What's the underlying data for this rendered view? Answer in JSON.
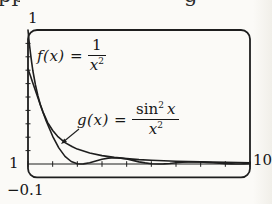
{
  "colors": {
    "ink": "#1e1e1e",
    "paper": "#fbfaf7"
  },
  "figure": {
    "top_cropped_text": {
      "left_fragment": "pp",
      "right_fragment": "g"
    },
    "labels": {
      "f": {
        "prefix": "f(x) =",
        "numerator": "1",
        "den_base": "x",
        "den_exp": "2"
      },
      "g": {
        "prefix": "g(x) =",
        "num_func": "sin",
        "num_exp": "2",
        "num_var": "x",
        "den_base": "x",
        "den_exp": "2"
      }
    },
    "axis_labels": {
      "y_max": "1",
      "x_min": "1",
      "x_max": "10",
      "y_min": "−0.1"
    }
  },
  "chart_data": {
    "type": "line",
    "title": "",
    "xlabel": "",
    "ylabel": "",
    "window": {
      "xmin": 1,
      "xmax": 10,
      "ymin": -0.1,
      "ymax": 1
    },
    "x_tick_step": 1,
    "y_tick_step": 0.1,
    "grid": false,
    "legend_position": "inline-annotations",
    "frame_px": {
      "left": 28,
      "right": 250,
      "top": 30,
      "bottom": 177.4
    },
    "series": [
      {
        "name": "f(x) = 1/x^2",
        "x": [
          1,
          1.05,
          1.1,
          1.15,
          1.2,
          1.3,
          1.4,
          1.5,
          1.6,
          1.8,
          2,
          2.2,
          2.5,
          2.8,
          3,
          3.5,
          4,
          4.5,
          5,
          5.5,
          6,
          6.5,
          7,
          7.5,
          8,
          8.5,
          9,
          9.5,
          10
        ],
        "y": [
          1,
          0.907,
          0.826,
          0.756,
          0.694,
          0.592,
          0.51,
          0.444,
          0.391,
          0.309,
          0.25,
          0.207,
          0.16,
          0.128,
          0.111,
          0.082,
          0.063,
          0.049,
          0.04,
          0.033,
          0.028,
          0.024,
          0.02,
          0.018,
          0.016,
          0.014,
          0.012,
          0.011,
          0.01
        ]
      },
      {
        "name": "g(x) = sin^2(x)/x^2",
        "x": [
          1,
          1.1,
          1.2,
          1.3,
          1.4,
          1.5,
          1.6,
          1.75,
          2,
          2.25,
          2.5,
          2.75,
          3,
          3.14,
          3.25,
          3.5,
          3.75,
          4,
          4.25,
          4.5,
          4.75,
          5,
          5.25,
          5.5,
          5.75,
          6,
          6.28,
          6.5,
          6.75,
          7,
          7.25,
          7.5,
          7.75,
          8,
          8.25,
          8.5,
          8.75,
          9,
          9.25,
          9.42,
          9.6,
          9.75,
          10
        ],
        "y": [
          0.708,
          0.656,
          0.603,
          0.549,
          0.495,
          0.442,
          0.39,
          0.316,
          0.207,
          0.12,
          0.057,
          0.019,
          0.002,
          0,
          0.001,
          0.01,
          0.023,
          0.036,
          0.044,
          0.047,
          0.044,
          0.037,
          0.027,
          0.016,
          0.008,
          0.002,
          0,
          0.001,
          0.004,
          0.009,
          0.013,
          0.016,
          0.016,
          0.015,
          0.012,
          0.009,
          0.005,
          0.002,
          0.0004,
          0,
          0.0002,
          0.001,
          0.003
        ]
      }
    ],
    "annotations": [
      {
        "type": "arrow",
        "target": "curve-g",
        "line": [
          79,
          129,
          65,
          140.5
        ],
        "head": [
          [
            61,
            144
          ],
          [
            64.2,
            138.5
          ],
          [
            67,
            141.9
          ]
        ]
      }
    ]
  }
}
